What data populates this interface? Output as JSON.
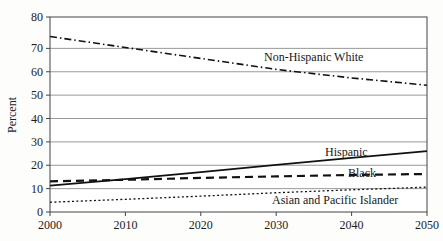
{
  "chart_data": {
    "type": "line",
    "title": "",
    "xlabel": "",
    "ylabel": "Percent",
    "xlim": [
      2000,
      2050
    ],
    "ylim": [
      0,
      80
    ],
    "grid": true,
    "gridlines_axis": "y",
    "legend_position": "inline-labels",
    "x_ticks": [
      2000,
      2010,
      2020,
      2030,
      2040,
      2050
    ],
    "y_ticks": [
      0,
      10,
      20,
      30,
      40,
      50,
      60,
      70,
      80
    ],
    "x": [
      2000,
      2010,
      2020,
      2030,
      2040,
      2050
    ],
    "series": [
      {
        "name": "Non-Hispanic White",
        "style": "dash-dot",
        "color": "#111111",
        "values": [
          72,
          67.5,
          63,
          58.5,
          55,
          52
        ]
      },
      {
        "name": "Hispanic",
        "style": "solid",
        "color": "#111111",
        "values": [
          10.8,
          13.5,
          16.4,
          19.3,
          22.2,
          25
        ]
      },
      {
        "name": "Black",
        "style": "dashed",
        "color": "#111111",
        "values": [
          12.6,
          13.2,
          14,
          14.6,
          15.2,
          15.6
        ]
      },
      {
        "name": "Asian and Pacific Islander",
        "style": "dotted",
        "color": "#111111",
        "values": [
          4,
          5.2,
          6.5,
          7.9,
          9.1,
          10.2
        ]
      }
    ],
    "annotations": [
      {
        "text": "Non-Hispanic White",
        "x": 2026,
        "y": 64
      },
      {
        "text": "Hispanic",
        "x": 2035,
        "y": 27.5
      },
      {
        "text": "Black",
        "x": 2040,
        "y": 19
      },
      {
        "text": "Asian and Pacific Islander",
        "x": 2040,
        "y": 5
      }
    ]
  },
  "axis": {
    "y_label": "Percent",
    "y_ticks": [
      "0",
      "10",
      "20",
      "30",
      "40",
      "50",
      "60",
      "70",
      "80"
    ],
    "x_ticks": [
      "2000",
      "2010",
      "2020",
      "2030",
      "2040",
      "2050"
    ]
  },
  "labels": {
    "non_hispanic_white": "Non-Hispanic White",
    "hispanic": "Hispanic",
    "black": "Black",
    "asian_pacific_islander": "Asian and Pacific Islander"
  },
  "colors": {
    "line": "#111111",
    "grid": "#8d8d8d",
    "frame": "#555555",
    "background": "#fdfdfc",
    "text": "#1c1c1c"
  }
}
